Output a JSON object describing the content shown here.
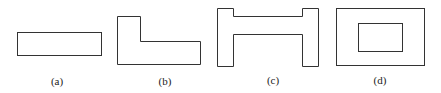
{
  "figures": [
    {
      "id": "a",
      "label": "(a)",
      "shape": "rectangle",
      "label_x": 57,
      "label_y": 75
    },
    {
      "id": "b",
      "label": "(b)",
      "shape": "L-shape",
      "label_x": 165,
      "label_y": 75
    },
    {
      "id": "c",
      "label": "(c)",
      "shape": "I-beam / H-shape",
      "label_x": 273,
      "label_y": 74
    },
    {
      "id": "d",
      "label": "(d)",
      "shape": "rectangle with rectangular hole",
      "label_x": 380,
      "label_y": 74
    }
  ],
  "colors": {
    "stroke": "#333333",
    "background": "#ffffff"
  }
}
